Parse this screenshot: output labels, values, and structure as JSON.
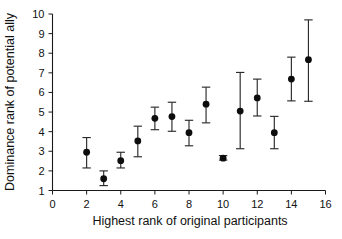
{
  "chart_data": {
    "type": "scatter",
    "title": "",
    "xlabel": "Highest rank of original participants",
    "ylabel": "Dominance rank of potential ally",
    "xlim": [
      0,
      16
    ],
    "ylim": [
      1,
      10
    ],
    "xticks": [
      0,
      2,
      4,
      6,
      8,
      10,
      12,
      14,
      16
    ],
    "yticks": [
      1,
      2,
      3,
      4,
      5,
      6,
      7,
      8,
      9,
      10
    ],
    "grid": false,
    "legend": "none",
    "marker": "filled-circle",
    "error_bars": "vertical-with-caps",
    "x": [
      2,
      3,
      4,
      5,
      6,
      7,
      8,
      9,
      10,
      11,
      12,
      13,
      14,
      15
    ],
    "values": [
      2.95,
      1.6,
      2.52,
      3.53,
      4.68,
      4.77,
      3.95,
      5.4,
      2.65,
      5.05,
      5.72,
      3.95,
      6.68,
      7.67
    ],
    "err_low": [
      2.15,
      1.25,
      2.15,
      2.72,
      4.1,
      4.02,
      3.28,
      4.45,
      2.55,
      3.13,
      4.8,
      3.13,
      5.57,
      5.55
    ],
    "err_high": [
      3.7,
      2.0,
      2.95,
      4.28,
      5.25,
      5.5,
      4.58,
      6.27,
      2.78,
      7.02,
      6.68,
      4.78,
      7.8,
      9.7
    ],
    "points": [
      {
        "x": 2,
        "y": 2.95,
        "low": 2.15,
        "high": 3.7
      },
      {
        "x": 3,
        "y": 1.6,
        "low": 1.25,
        "high": 2.0
      },
      {
        "x": 4,
        "y": 2.52,
        "low": 2.15,
        "high": 2.95
      },
      {
        "x": 5,
        "y": 3.53,
        "low": 2.72,
        "high": 4.28
      },
      {
        "x": 6,
        "y": 4.68,
        "low": 4.1,
        "high": 5.25
      },
      {
        "x": 7,
        "y": 4.77,
        "low": 4.02,
        "high": 5.5
      },
      {
        "x": 8,
        "y": 3.95,
        "low": 3.28,
        "high": 4.58
      },
      {
        "x": 9,
        "y": 5.4,
        "low": 4.45,
        "high": 6.27
      },
      {
        "x": 10,
        "y": 2.65,
        "low": 2.55,
        "high": 2.78
      },
      {
        "x": 11,
        "y": 5.05,
        "low": 3.13,
        "high": 7.02
      },
      {
        "x": 12,
        "y": 5.72,
        "low": 4.8,
        "high": 6.68
      },
      {
        "x": 13,
        "y": 3.95,
        "low": 3.13,
        "high": 4.78
      },
      {
        "x": 14,
        "y": 6.68,
        "low": 5.57,
        "high": 7.8
      },
      {
        "x": 15,
        "y": 7.67,
        "low": 5.55,
        "high": 9.7
      }
    ],
    "colors": {
      "marker": "#0d0d0d",
      "error_bar": "#2b2b2b",
      "axis": "#1a1a1a",
      "background": "#ffffff",
      "text": "#111111"
    }
  },
  "axis": {
    "x_title": "Highest rank of original participants",
    "y_title": "Dominance rank of potential ally",
    "x_tick_labels": [
      "0",
      "2",
      "4",
      "6",
      "8",
      "10",
      "12",
      "14",
      "16"
    ],
    "y_tick_labels": [
      "1",
      "2",
      "3",
      "4",
      "5",
      "6",
      "7",
      "8",
      "9",
      "10"
    ]
  }
}
